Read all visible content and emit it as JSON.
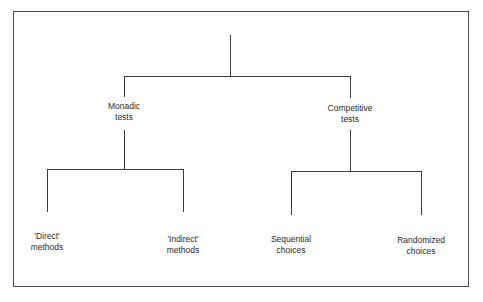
{
  "diagram": {
    "type": "tree",
    "root": {
      "label": "",
      "children": [
        {
          "id": "monadic",
          "line1": "Monadic",
          "line2": "tests",
          "children": [
            {
              "id": "direct",
              "line1": "'Direct'",
              "line2": "methods"
            },
            {
              "id": "indirect",
              "line1": "'Indirect'",
              "line2": "methods"
            }
          ]
        },
        {
          "id": "competitive",
          "line1": "Competitive",
          "line2": "tests",
          "children": [
            {
              "id": "sequential",
              "line1": "Sequential",
              "line2": "choices"
            },
            {
              "id": "randomized",
              "line1": "Randomized",
              "line2": "choices"
            }
          ]
        }
      ]
    },
    "colors": {
      "line": "#3c3c3c",
      "text": "#2a2a2a",
      "background": "#ffffff"
    }
  }
}
